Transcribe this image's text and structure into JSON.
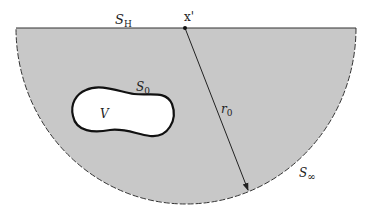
{
  "diagram": {
    "colors": {
      "region_fill": "#c8c8c8",
      "boundary": "#333333",
      "inclusion_fill": "#ffffff",
      "inclusion_stroke": "#111111"
    },
    "labels": {
      "surface_h": {
        "main": "S",
        "sub": "H"
      },
      "source_point": "x'",
      "surface_0": {
        "main": "S",
        "sub": "0"
      },
      "volume": "V",
      "radius": {
        "main": "r",
        "sub": "0"
      },
      "surface_inf": {
        "main": "S",
        "sub": "∞"
      }
    }
  }
}
